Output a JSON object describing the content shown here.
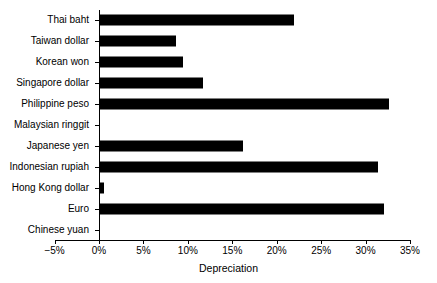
{
  "chart_data": {
    "type": "bar",
    "orientation": "horizontal",
    "title": "",
    "xlabel": "Depreciation",
    "ylabel": "",
    "xlim": [
      -5,
      35
    ],
    "xticks": [
      -5,
      0,
      5,
      10,
      15,
      20,
      25,
      30,
      35
    ],
    "xtick_labels": [
      "−5%",
      "0%",
      "5%",
      "10%",
      "15%",
      "20%",
      "25%",
      "30%",
      "35%"
    ],
    "grid": false,
    "legend": null,
    "bar_color": "#000000",
    "categories": [
      "Thai baht",
      "Taiwan dollar",
      "Korean won",
      "Singapore  dollar",
      "Philippine peso",
      "Malaysian ringgit",
      "Japanese yen",
      "Indonesian rupiah",
      "Hong Kong dollar",
      "Euro",
      "Chinese yuan"
    ],
    "values": [
      22.0,
      8.7,
      9.5,
      11.7,
      32.6,
      0.0,
      16.2,
      31.4,
      0.6,
      32.1,
      0.0
    ]
  }
}
